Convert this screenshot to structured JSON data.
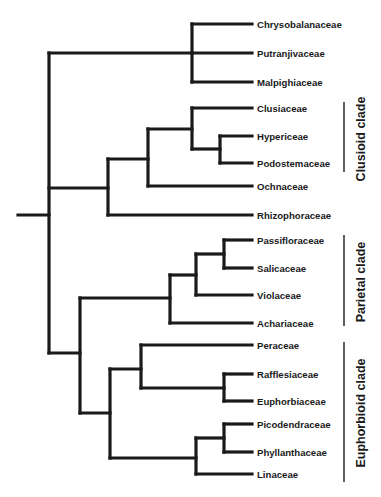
{
  "figure": {
    "type": "phylogenetic-tree (cladogram)",
    "orientation": "left-to-right",
    "line_color": "#1a1a1a",
    "background": "#ffffff"
  },
  "taxa": [
    {
      "name": "Chrysobalanaceae",
      "y": 24
    },
    {
      "name": "Putranjivaceae",
      "y": 53
    },
    {
      "name": "Malpighiaceae",
      "y": 82
    },
    {
      "name": "Clusiaceae",
      "y": 108
    },
    {
      "name": "Hypericeae",
      "y": 136
    },
    {
      "name": "Podostemaceae",
      "y": 163
    },
    {
      "name": "Ochnaceae",
      "y": 186
    },
    {
      "name": "Rhizophoraceae",
      "y": 215
    },
    {
      "name": "Passifloraceae",
      "y": 240
    },
    {
      "name": "Salicaceae",
      "y": 268
    },
    {
      "name": "Violaceae",
      "y": 295
    },
    {
      "name": "Achariaceae",
      "y": 323
    },
    {
      "name": "Peraceae",
      "y": 345
    },
    {
      "name": "Rafflesiaceae",
      "y": 374
    },
    {
      "name": "Euphorbiaceae",
      "y": 401
    },
    {
      "name": "Picodendraceae",
      "y": 424
    },
    {
      "name": "Phyllanthaceae",
      "y": 452
    },
    {
      "name": "Linaceae",
      "y": 474
    }
  ],
  "clades": [
    {
      "label": "Clusioid clade",
      "members": [
        "Clusiaceae",
        "Hypericeae",
        "Podostemaceae"
      ],
      "bar_y1": 102,
      "bar_y2": 172
    },
    {
      "label": "Parietal clade",
      "members": [
        "Passifloraceae",
        "Salicaceae",
        "Violaceae",
        "Achariaceae"
      ],
      "bar_y1": 235,
      "bar_y2": 326
    },
    {
      "label": "Euphorbioid clade",
      "members": [
        "Peraceae",
        "Rafflesiaceae",
        "Euphorbiaceae",
        "Picodendraceae",
        "Phyllanthaceae",
        "Linaceae"
      ],
      "bar_y1": 342,
      "bar_y2": 482
    }
  ],
  "topology_newick": "((Chrysobalanaceae,Putranjivaceae,Malpighiaceae),(((Clusiaceae,(Hypericeae,Podostemaceae)),Ochnaceae),Rhizophoraceae),((((Passifloraceae,Salicaceae),Violaceae),Achariaceae),((Peraceae,(Rafflesiaceae,Euphorbiaceae)),((Picodendraceae,Phyllanthaceae),Linaceae))));",
  "caption_fragment": ""
}
